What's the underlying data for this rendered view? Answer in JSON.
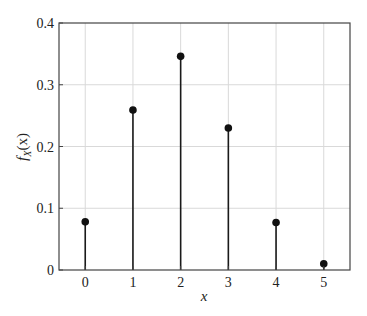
{
  "chart_data": {
    "type": "stem",
    "title": "",
    "xlabel": "x",
    "ylabel": "f_X(x)",
    "ylabel_main": "f",
    "ylabel_sub": "X",
    "ylabel_tail": "(x)",
    "x": [
      0,
      1,
      2,
      3,
      4,
      5
    ],
    "values": [
      0.078,
      0.259,
      0.346,
      0.23,
      0.077,
      0.01
    ],
    "xlim": [
      -0.55,
      5.55
    ],
    "ylim": [
      0,
      0.4
    ],
    "xticks": [
      0,
      1,
      2,
      3,
      4,
      5
    ],
    "xtick_labels": [
      "0",
      "1",
      "2",
      "3",
      "4",
      "5"
    ],
    "yticks": [
      0,
      0.1,
      0.2,
      0.3,
      0.4
    ],
    "ytick_labels": [
      "0",
      "0.1",
      "0.2",
      "0.3",
      "0.4"
    ],
    "grid": true,
    "legend": null,
    "colors": {
      "stem": "#1a1a1a",
      "marker": "#111111",
      "grid": "#d9d9d9",
      "frame": "#444444"
    }
  }
}
